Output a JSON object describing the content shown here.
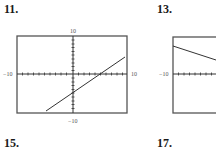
{
  "problems": [
    {
      "number": "11.",
      "x": 4,
      "y": 3
    },
    {
      "number": "13.",
      "x": 157,
      "y": 3
    },
    {
      "number": "15.",
      "x": 4,
      "y": 137
    },
    {
      "number": "17.",
      "x": 157,
      "y": 137
    }
  ],
  "graphs": [
    {
      "id": "graph-11",
      "window": {
        "xmin": -10,
        "xmax": 10,
        "ymin": -10,
        "ymax": 10
      },
      "labels": {
        "top": "10",
        "bottom": "−10",
        "left": "−10",
        "right": "10"
      },
      "line": {
        "equation": "y = x - 5",
        "from": [
          -4.9,
          -9.6
        ],
        "to": [
          9.4,
          4.4
        ]
      }
    },
    {
      "id": "graph-13",
      "window": {
        "xmin": -10,
        "xmax": 10,
        "ymin": -10,
        "ymax": 10
      },
      "labels": {
        "left": "−10"
      },
      "line": {
        "description": "decreasing line, partially visible (cropped)"
      }
    }
  ],
  "colors": {
    "frame": "#555555",
    "line": "#333333",
    "text": "#1a1a1a"
  }
}
